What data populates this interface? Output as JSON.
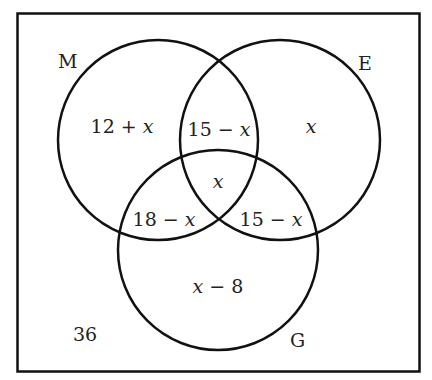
{
  "diagram": {
    "type": "venn-3",
    "colors": {
      "stroke": "#111111",
      "text": "#222222",
      "background": "#ffffff"
    },
    "sets": [
      {
        "id": "M",
        "label": "M"
      },
      {
        "id": "E",
        "label": "E"
      },
      {
        "id": "G",
        "label": "G"
      }
    ],
    "regions": {
      "m_only": {
        "num": "12 + ",
        "var": "x"
      },
      "e_only": {
        "num": "",
        "var": "x"
      },
      "m_and_e": {
        "num": "15 − ",
        "var": "x"
      },
      "center": {
        "num": "",
        "var": "x"
      },
      "m_and_g": {
        "num": "18 − ",
        "var": "x"
      },
      "e_and_g": {
        "num": "15 − ",
        "var": "x"
      },
      "g_only": {
        "var": "x",
        "num": " − 8"
      },
      "outside": {
        "num": "36",
        "var": ""
      }
    }
  }
}
